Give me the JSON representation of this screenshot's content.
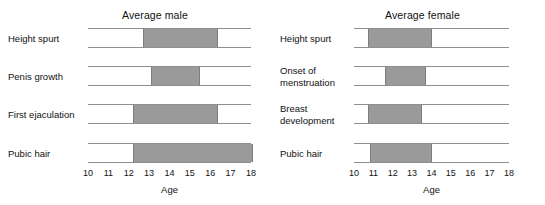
{
  "chart_data": {
    "type": "bar",
    "orientation": "horizontal",
    "title": "",
    "xlabel": "Age",
    "ylabel": "",
    "xlim": [
      10,
      18
    ],
    "xticks": [
      10,
      11,
      12,
      13,
      14,
      15,
      16,
      17,
      18
    ],
    "grid": false,
    "legend": "none",
    "bar_color": "#9a9a9a",
    "line_color": "#8e8e8e",
    "panels": [
      {
        "title": "Average male",
        "axis_label": "Age",
        "ticks": [
          "10",
          "11",
          "12",
          "13",
          "14",
          "15",
          "16",
          "17",
          "18"
        ],
        "rows": [
          {
            "label": "Height spurt",
            "start": 12.7,
            "end": 16.3
          },
          {
            "label": "Penis growth",
            "start": 13.1,
            "end": 15.4
          },
          {
            "label": "First ejaculation",
            "start": 12.2,
            "end": 16.3
          },
          {
            "label": "Pubic hair",
            "start": 12.2,
            "end": 18.2
          }
        ]
      },
      {
        "title": "Average female",
        "axis_label": "Age",
        "ticks": [
          "10",
          "11",
          "12",
          "13",
          "14",
          "15",
          "16",
          "17",
          "18"
        ],
        "rows": [
          {
            "label": "Height spurt",
            "start": 10.7,
            "end": 13.9
          },
          {
            "label": "Onset of\nmenstruation",
            "start": 11.6,
            "end": 13.6
          },
          {
            "label": "Breast\ndevelopment",
            "start": 10.7,
            "end": 13.4
          },
          {
            "label": "Pubic hair",
            "start": 10.8,
            "end": 13.9
          }
        ]
      }
    ]
  }
}
